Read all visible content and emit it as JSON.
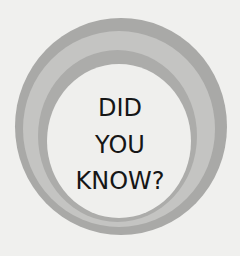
{
  "badge": {
    "lines": [
      "DID",
      "YOU",
      "KNOW?"
    ],
    "colors": {
      "background": "#f0f0ee",
      "outer_ring": "#a9a9a7",
      "middle_ring": "#c4c4c2",
      "inner_ring": "#acacaa",
      "core": "#efefed",
      "text": "#161616"
    }
  }
}
